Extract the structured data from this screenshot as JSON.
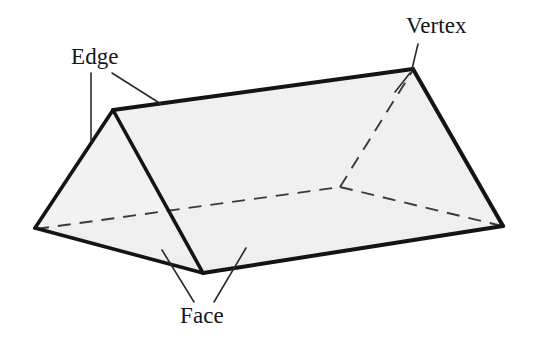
{
  "figure": {
    "shape_name": "triangular-prism",
    "background_color": "#ffffff",
    "face_fill_color": "#f1f1f1",
    "face_fill_color_dark": "#ececec",
    "stroke_color": "#1a1a1a",
    "leader_color": "#2b2b2b",
    "hidden_edge_style": "dashed"
  },
  "labels": {
    "vertex": "Vertex",
    "edge": "Edge",
    "face": "Face"
  },
  "geometry": {
    "vertices": {
      "left_bottom": {
        "x": 35,
        "y": 228
      },
      "ridge_left_top": {
        "x": 113,
        "y": 110
      },
      "front_bottom": {
        "x": 203,
        "y": 273
      },
      "apex_right_top": {
        "x": 413,
        "y": 69
      },
      "right_bottom": {
        "x": 503,
        "y": 226
      },
      "hidden_back": {
        "x": 340,
        "y": 187
      }
    },
    "visible_edges": [
      "left_bottom -> ridge_left_top",
      "ridge_left_top -> apex_right_top",
      "apex_right_top -> right_bottom",
      "right_bottom -> front_bottom",
      "front_bottom -> left_bottom",
      "ridge_left_top -> front_bottom"
    ],
    "hidden_edges": [
      "left_bottom -> hidden_back",
      "hidden_back -> right_bottom",
      "hidden_back -> apex_right_top"
    ]
  },
  "leaders": {
    "vertex": [
      {
        "x1": 418,
        "y1": 44,
        "x2": 412,
        "y2": 69
      }
    ],
    "vertex_tick": [
      {
        "x1": 410,
        "y1": 72,
        "x2": 396,
        "y2": 90
      }
    ],
    "edge": [
      {
        "x1": 91,
        "y1": 73,
        "x2": 91,
        "y2": 141
      },
      {
        "x1": 112,
        "y1": 73,
        "x2": 160,
        "y2": 103
      }
    ],
    "face": [
      {
        "x1": 162,
        "y1": 250,
        "x2": 194,
        "y2": 302
      },
      {
        "x1": 246,
        "y1": 248,
        "x2": 214,
        "y2": 302
      }
    ]
  }
}
